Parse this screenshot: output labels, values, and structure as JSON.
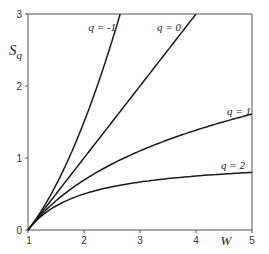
{
  "chart_data": {
    "type": "line",
    "title": "",
    "xlabel": "W",
    "ylabel": "S_q",
    "xlim": [
      1,
      5
    ],
    "ylim": [
      0,
      3
    ],
    "grid": false,
    "legend": "inline labels at curve ends",
    "x_ticks": [
      "1",
      "2",
      "3",
      "4",
      "5"
    ],
    "y_ticks": [
      "0",
      "1",
      "2",
      "3"
    ],
    "series": [
      {
        "name": "q = -1",
        "formula": "S = (W^2 - 1)/2",
        "x": [
          1,
          1.25,
          1.5,
          1.75,
          2,
          2.25,
          2.5,
          2.646
        ],
        "values": [
          0,
          0.28,
          0.63,
          1.03,
          1.5,
          2.03,
          2.63,
          3.0
        ]
      },
      {
        "name": "q = 0",
        "formula": "S = W - 1",
        "x": [
          1,
          2,
          3,
          4
        ],
        "values": [
          0,
          1,
          2,
          3
        ]
      },
      {
        "name": "q = 1",
        "formula": "S = ln W",
        "x": [
          1,
          1.5,
          2,
          2.5,
          3,
          3.5,
          4,
          4.5,
          5
        ],
        "values": [
          0,
          0.41,
          0.69,
          0.92,
          1.1,
          1.25,
          1.39,
          1.5,
          1.61
        ]
      },
      {
        "name": "q = 2",
        "formula": "S = 1 - 1/W",
        "x": [
          1,
          1.5,
          2,
          2.5,
          3,
          3.5,
          4,
          4.5,
          5
        ],
        "values": [
          0,
          0.33,
          0.5,
          0.6,
          0.67,
          0.71,
          0.75,
          0.78,
          0.8
        ]
      }
    ]
  },
  "labels": {
    "xlabel": "W",
    "ylabel_main": "S",
    "ylabel_sub": "q",
    "q_neg1": "q = -1",
    "q_0": "q = 0",
    "q_1": "q = 1",
    "q_2": "q = 2",
    "xt1": "1",
    "xt2": "2",
    "xt3": "3",
    "xt4": "4",
    "xt5": "5",
    "yt0": "0",
    "yt1": "1",
    "yt2": "2",
    "yt3": "3"
  }
}
